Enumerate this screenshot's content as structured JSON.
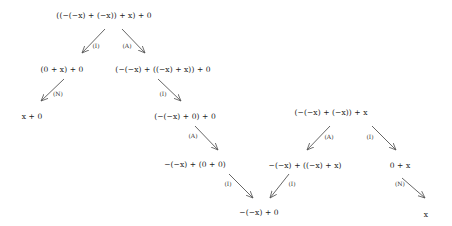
{
  "nodes": {
    "root": "((−(−x) + (−x)) + x) + 0",
    "n1": "(0 + x) + 0",
    "n2": "(−(−x) + ((−x) + x)) + 0",
    "n3": "x + 0",
    "n4": "(−(−x) + 0) + 0",
    "n5": "−(−x) + (0 + 0)",
    "n6": "−(−x) + 0",
    "root2": "(−(−x) + (−x)) + x",
    "n7": "−(−x) + ((−x) + x)",
    "n8": "0 + x",
    "n9": "x"
  },
  "edges": {
    "e1": "(I)",
    "e2": "(A)",
    "e3": "(N)",
    "e4": "(I)",
    "e5": "(A)",
    "e6": "(I)",
    "e7": "(I)",
    "e8": "(A)",
    "e9": "(I)",
    "e10": "(N)"
  },
  "colors": {
    "arrow": "#555555",
    "text": "#222222"
  }
}
